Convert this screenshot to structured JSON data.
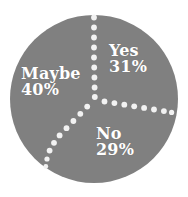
{
  "chart_data": {
    "type": "pie",
    "title": "",
    "subtitle": "",
    "xlabel": "",
    "ylabel": "",
    "legend_position": "none",
    "grid": false,
    "units": "percent",
    "categories": [
      "Yes",
      "No",
      "Maybe"
    ],
    "values": [
      31,
      29,
      40
    ],
    "slices": [
      {
        "label": "Yes",
        "value": 31,
        "value_text": "31%",
        "start_angle_deg": 0,
        "end_angle_deg": 111.6,
        "color": "#808080"
      },
      {
        "label": "No",
        "value": 29,
        "value_text": "29%",
        "start_angle_deg": 111.6,
        "end_angle_deg": 216.0,
        "color": "#808080"
      },
      {
        "label": "Maybe",
        "value": 40,
        "value_text": "40%",
        "start_angle_deg": 216.0,
        "end_angle_deg": 360,
        "color": "#808080"
      }
    ],
    "total": 100,
    "colors": {
      "fill": "#808080",
      "background": "#ffffff",
      "label_text": "#ffffff",
      "divider_dots": "#f2f2f2"
    },
    "geometry": {
      "center_x": 94,
      "center_y": 99,
      "radius": 84,
      "divider_style": "dotted",
      "divider_dot_radius": 2.8
    }
  },
  "labels": {
    "yes": {
      "name": "Yes",
      "value": "31%"
    },
    "no": {
      "name": "No",
      "value": "29%"
    },
    "maybe": {
      "name": "Maybe",
      "value": "40%"
    }
  }
}
